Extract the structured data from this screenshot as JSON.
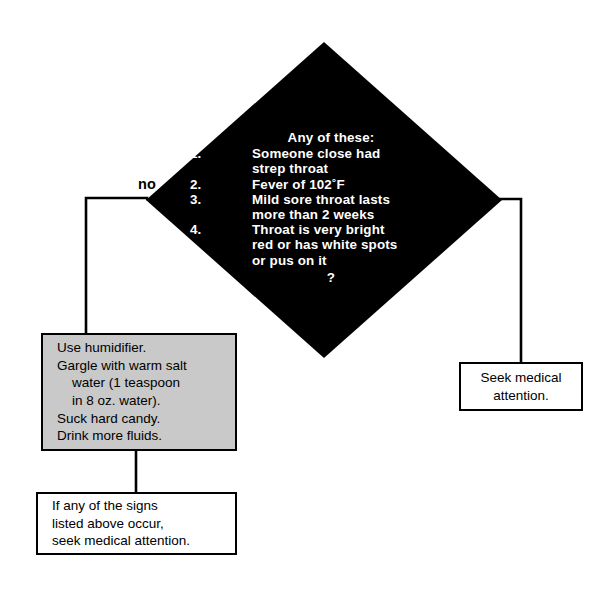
{
  "diagram": {
    "type": "flowchart",
    "colors": {
      "decision_fill": "#000000",
      "decision_text": "#ffffff",
      "selfcare_fill": "#c9c9c9",
      "outline": "#000000",
      "page_background": "#ffffff"
    }
  },
  "decision": {
    "heading": "Any of these:",
    "items": [
      {
        "num": "1.",
        "lines": [
          "Someone close had",
          "strep  throat"
        ]
      },
      {
        "num": "2.",
        "lines": [
          "Fever of 102˚F"
        ]
      },
      {
        "num": "3.",
        "lines": [
          "Mild sore throat lasts",
          "more than 2 weeks"
        ]
      },
      {
        "num": "4.",
        "lines": [
          "Throat is very bright",
          "red or has white spots",
          "or pus on it"
        ]
      }
    ],
    "question_mark": "?"
  },
  "branches": {
    "no_label": "no",
    "yes_label": "yes"
  },
  "boxes": {
    "selfcare": {
      "lines": [
        "Use humidifier.",
        "Gargle with warm salt",
        "water (1 teaspoon",
        "in 8 oz. water).",
        "Suck hard candy.",
        "Drink more fluids."
      ]
    },
    "signs": {
      "lines": [
        "If any of the signs",
        "listed above occur,",
        "seek medical attention."
      ]
    },
    "seek": {
      "lines": [
        "Seek medical",
        "attention."
      ]
    }
  }
}
